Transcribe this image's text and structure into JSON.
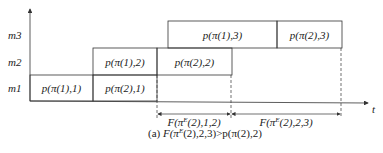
{
  "diagram": {
    "type": "gantt-schedule",
    "machines": [
      {
        "id": "m1",
        "label": "m1",
        "y_label": 88
      },
      {
        "id": "m2",
        "label": "m2",
        "y_label": 62
      },
      {
        "id": "m3",
        "label": "m3",
        "y_label": 35
      }
    ],
    "jobs": [
      {
        "machine": "m1",
        "label": "p(π(1),1)",
        "x": 30,
        "y": 75,
        "w": 63,
        "h": 26
      },
      {
        "machine": "m1",
        "label": "p(π(2),1)",
        "x": 93,
        "y": 75,
        "w": 64,
        "h": 26
      },
      {
        "machine": "m2",
        "label": "p(π(1),2)",
        "x": 93,
        "y": 48,
        "w": 64,
        "h": 27
      },
      {
        "machine": "m2",
        "label": "p(π(2),2)",
        "x": 157,
        "y": 48,
        "w": 75,
        "h": 27
      },
      {
        "machine": "m3",
        "label": "p(π(1),3)",
        "x": 168,
        "y": 21,
        "w": 109,
        "h": 27
      },
      {
        "machine": "m3",
        "label": "p(π(2),3)",
        "x": 277,
        "y": 21,
        "w": 65,
        "h": 27
      }
    ],
    "time_axis_label": "t",
    "intervals": [
      {
        "label": "F(π^E(2),1,2)",
        "base": "F(π",
        "sup": "E",
        "rest": "(2),1,2)",
        "x1": 157,
        "x2": 231
      },
      {
        "label": "F(π^E(2),2,3)",
        "base": "F(π",
        "sup": "E",
        "rest": "(2),2,3)",
        "x1": 231,
        "x2": 341
      }
    ],
    "caption": {
      "prefix": "(a) ",
      "base": "F(π",
      "sup": "E",
      "rest": "(2),2,3)>p(π(2),2)",
      "full": "(a) F(π^E(2),2,3)>p(π(2),2)"
    }
  }
}
